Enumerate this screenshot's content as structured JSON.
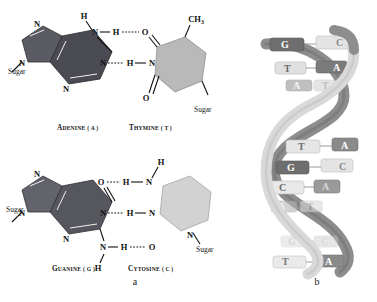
{
  "figure": {
    "subfigures": [
      {
        "id": "a",
        "label": "a",
        "caption": "Complementary base pairs held together by hydrogen bonds"
      },
      {
        "id": "b",
        "label": "b",
        "caption": "DNA double helix"
      }
    ]
  },
  "panel_a": {
    "pair_top": {
      "purine": {
        "name": "ADENINE",
        "code": "A",
        "label_main": "A",
        "label_small": "DENINE",
        "paren": "( A )",
        "color": "#4a4a52",
        "ring_type": "purine",
        "atoms": [
          "N",
          "N",
          "N",
          "N"
        ],
        "sugar_label": "Sugar"
      },
      "pyrimidine": {
        "name": "THYMINE",
        "code": "T",
        "label_main": "T",
        "label_small": "HYMINE",
        "paren": "( T )",
        "color": "#b9b9b9",
        "ring_type": "pyrimidine",
        "atoms": [
          "O",
          "O",
          "N",
          "CH3"
        ],
        "methyl_label": "CH",
        "methyl_sub": "3",
        "sugar_label": "Sugar"
      },
      "hydrogen_bonds": 2,
      "bond_atoms": [
        "H",
        "N",
        "H",
        "O",
        "N",
        "H",
        "N"
      ]
    },
    "pair_bottom": {
      "purine": {
        "name": "GUANINE",
        "code": "G",
        "label_main": "G",
        "label_small": "UANINE",
        "paren": "( G )",
        "color": "#56565e",
        "ring_type": "purine",
        "atoms": [
          "N",
          "N",
          "N",
          "O"
        ],
        "sugar_label": "Sugar"
      },
      "pyrimidine": {
        "name": "CYTOSINE",
        "code": "C",
        "label_main": "C",
        "label_small": "YTOSINE",
        "paren": "( C )",
        "color": "#d2d2d2",
        "ring_type": "pyrimidine",
        "atoms": [
          "N",
          "N",
          "O",
          "H"
        ],
        "sugar_label": "Sugar"
      },
      "hydrogen_bonds": 3,
      "bond_atoms": [
        "H",
        "O",
        "H",
        "N",
        "N",
        "H",
        "N",
        "N",
        "H",
        "O",
        "H"
      ]
    }
  },
  "panel_b": {
    "label": "b",
    "strand_colors": {
      "back": "#8d8d8d",
      "front": "#d9d9d9"
    },
    "base_pairs": [
      {
        "left": "G",
        "right": "C",
        "left_shade": "dark",
        "right_shade": "light"
      },
      {
        "left": "T",
        "right": "A",
        "left_shade": "light",
        "right_shade": "dark"
      },
      {
        "left": "A",
        "right": "T",
        "left_shade": "dark",
        "right_shade": "light"
      },
      {
        "left": "T",
        "right": "A",
        "left_shade": "light",
        "right_shade": "dark"
      },
      {
        "left": "G",
        "right": "C",
        "left_shade": "dark",
        "right_shade": "light"
      },
      {
        "left": "C",
        "right": "A",
        "left_shade": "light",
        "right_shade": "dark"
      },
      {
        "left": "A",
        "right": "T",
        "left_shade": "dark",
        "right_shade": "light"
      },
      {
        "left": "G",
        "right": "C",
        "left_shade": "light",
        "right_shade": "dark"
      },
      {
        "left": "T",
        "right": "A",
        "left_shade": "light",
        "right_shade": "dark"
      }
    ]
  }
}
